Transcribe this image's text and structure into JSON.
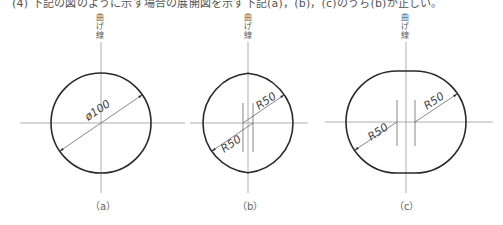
{
  "caption": "(4)  下記の図のように示す場合の展開図を示す下記(a)，(b)，(c)のうち(b)が正しい。",
  "bend_line_label": [
    "曲",
    "げ",
    "線"
  ],
  "figures": [
    {
      "id": "a",
      "label": "（a）",
      "dimension": "ø100",
      "shape": "circle"
    },
    {
      "id": "b",
      "label": "（b）",
      "dimensions": [
        "R50",
        "R50"
      ],
      "shape": "lens"
    },
    {
      "id": "c",
      "label": "（c）",
      "dimensions": [
        "R50",
        "R50"
      ],
      "shape": "oval"
    }
  ],
  "colors": {
    "outline": "#2a2a2a",
    "centerline": "#9a9a9a",
    "text": "#555555"
  }
}
